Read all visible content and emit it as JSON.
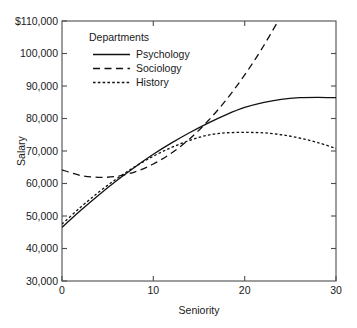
{
  "chart_data": {
    "type": "line",
    "title": "",
    "xlabel": "Seniority",
    "ylabel": "Salary",
    "xlim": [
      0,
      30
    ],
    "ylim": [
      30000,
      110000
    ],
    "grid": false,
    "legend_position": "top-left-inside",
    "legend_title": "Departments",
    "x_ticks": [
      0,
      10,
      20,
      30
    ],
    "x_tick_labels": [
      "0",
      "10",
      "20",
      "30"
    ],
    "y_ticks": [
      30000,
      40000,
      50000,
      60000,
      70000,
      80000,
      90000,
      100000,
      110000
    ],
    "y_tick_labels": [
      "30,000",
      "40,000",
      "50,000",
      "60,000",
      "70,000",
      "80,000",
      "90,000",
      "100,000",
      "$110,000"
    ],
    "x": [
      0,
      2,
      4,
      6,
      8,
      10,
      12,
      14,
      16,
      18,
      20,
      22,
      24,
      26,
      28,
      30
    ],
    "series": [
      {
        "name": "Psychology",
        "style": "solid",
        "color": "#111111",
        "values": [
          46500,
          51600,
          56400,
          60900,
          65100,
          69000,
          72500,
          75700,
          78600,
          81200,
          83400,
          84900,
          85900,
          86400,
          86500,
          86400
        ]
      },
      {
        "name": "Sociology",
        "style": "dashed",
        "color": "#111111",
        "values": [
          64200,
          62500,
          61900,
          62200,
          63600,
          66000,
          69400,
          73800,
          79300,
          85800,
          93400,
          102000,
          111700,
          null,
          null,
          null
        ]
      },
      {
        "name": "History",
        "style": "dotted",
        "color": "#111111",
        "values": [
          47500,
          52600,
          57300,
          61500,
          65200,
          68400,
          71100,
          73300,
          74900,
          75600,
          75700,
          75600,
          75000,
          74000,
          72600,
          70800
        ]
      }
    ]
  },
  "axes": {
    "x_label": "Seniority",
    "y_label": "Salary"
  },
  "legend": {
    "title": "Departments",
    "entries": [
      {
        "label": "Psychology",
        "style": "solid"
      },
      {
        "label": "Sociology",
        "style": "dashed"
      },
      {
        "label": "History",
        "style": "dotted"
      }
    ]
  }
}
